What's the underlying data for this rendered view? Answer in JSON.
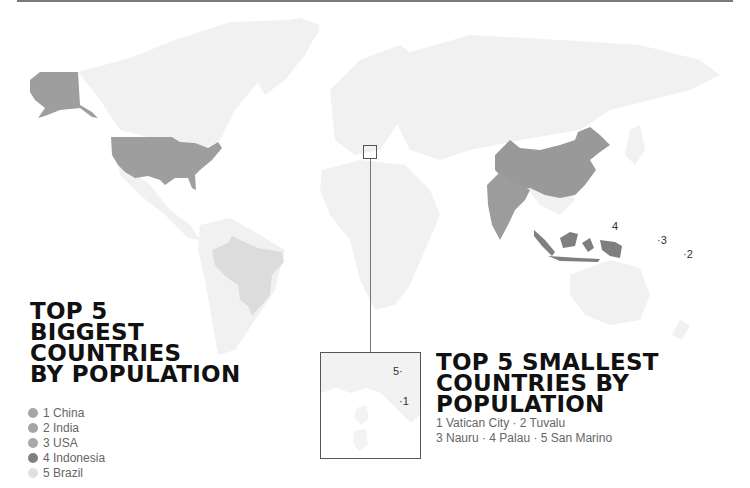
{
  "map": {
    "colors": {
      "land": "#f0f0f0",
      "china": "#999999",
      "india": "#9c9c9c",
      "usa": "#9e9e9e",
      "indonesia": "#7f7f7f",
      "brazil": "#dedede",
      "rule": "#7a7a7a"
    },
    "labels_pacific": [
      {
        "id": "4",
        "text": "4"
      },
      {
        "id": "3",
        "text": "·3"
      },
      {
        "id": "2",
        "text": "·2"
      }
    ],
    "inset": {
      "labels": [
        {
          "id": "5",
          "text": "5·"
        },
        {
          "id": "1",
          "text": "·1"
        }
      ]
    }
  },
  "biggest": {
    "title_lines": [
      "TOP 5",
      "BIGGEST",
      "COUNTRIES",
      "BY POPULATION"
    ],
    "legend": [
      {
        "rank": "1",
        "name": "China",
        "label": "1 China",
        "color": "#a6a6a6"
      },
      {
        "rank": "2",
        "name": "India",
        "label": "2 India",
        "color": "#a6a6a6"
      },
      {
        "rank": "3",
        "name": "USA",
        "label": "3 USA",
        "color": "#a8a8a8"
      },
      {
        "rank": "4",
        "name": "Indonesia",
        "label": "4 Indonesia",
        "color": "#808080"
      },
      {
        "rank": "5",
        "name": "Brazil",
        "label": "5 Brazil",
        "color": "#e0e0e0"
      }
    ]
  },
  "smallest": {
    "title_lines": [
      "TOP 5 SMALLEST",
      "COUNTRIES BY",
      "POPULATION"
    ],
    "list_lines": [
      "1 Vatican City · 2 Tuvalu",
      "3 Nauru · 4 Palau · 5 San Marino"
    ],
    "items": [
      {
        "rank": "1",
        "name": "Vatican City"
      },
      {
        "rank": "2",
        "name": "Tuvalu"
      },
      {
        "rank": "3",
        "name": "Nauru"
      },
      {
        "rank": "4",
        "name": "Palau"
      },
      {
        "rank": "5",
        "name": "San Marino"
      }
    ]
  }
}
